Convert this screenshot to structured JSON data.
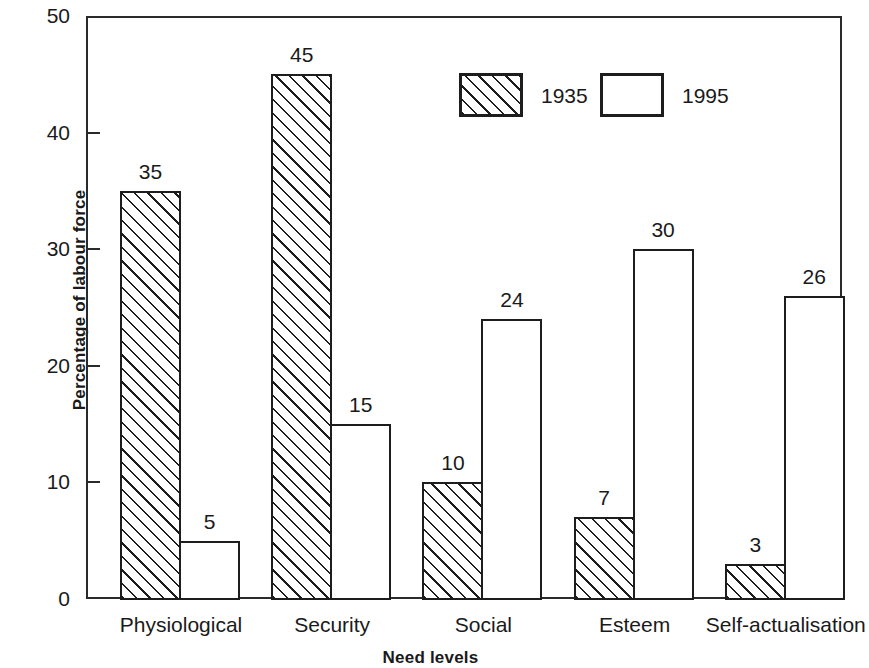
{
  "chart_data": {
    "type": "bar",
    "title": "",
    "xlabel": "Need levels",
    "ylabel": "Percentage of labour force",
    "ylim": [
      0,
      50
    ],
    "y_ticks": [
      0,
      10,
      20,
      30,
      40,
      50
    ],
    "grid": false,
    "legend_position": "top-center",
    "categories": [
      "Physiological",
      "Security",
      "Social",
      "Esteem",
      "Self-actualisation"
    ],
    "series": [
      {
        "name": "1935",
        "style": "hatched",
        "values": [
          35,
          45,
          10,
          7,
          3
        ],
        "value_labels": [
          "35",
          "45",
          "10",
          "7",
          "3"
        ]
      },
      {
        "name": "1995",
        "style": "white",
        "values": [
          5,
          15,
          24,
          30,
          26
        ],
        "value_labels": [
          "5",
          "15",
          "24",
          "30",
          "26"
        ]
      }
    ]
  },
  "axes": {
    "y_tick_labels": [
      "50",
      "40",
      "30",
      "20",
      "10",
      "0"
    ],
    "y_axis_title": "Percentage of labour force",
    "x_axis_title": "Need levels"
  },
  "legend": {
    "items": [
      {
        "label": "1935",
        "style": "hatched"
      },
      {
        "label": "1995",
        "style": "white"
      }
    ]
  },
  "colors": {
    "line": "#1d1d1d",
    "background": "#ffffff",
    "text": "#1a1a1a"
  }
}
